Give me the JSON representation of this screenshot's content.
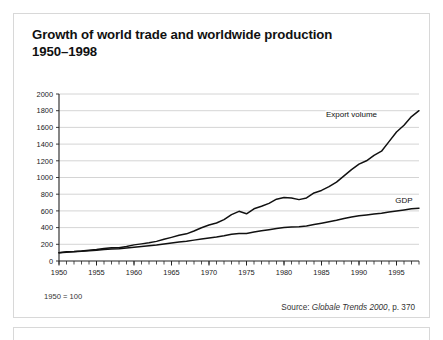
{
  "card": {
    "title_line1": "Growth of world trade and worldwide production",
    "title_line2": "1950–1998",
    "note_base": "1950 = 100",
    "source_prefix": "Source:",
    "source_title": "Globale Trends 2000",
    "source_page": ", p. 370"
  },
  "chart_data": {
    "type": "line",
    "title": "Growth of world trade and worldwide production 1950–1998",
    "subtitle": "1950 = 100",
    "xlabel": "",
    "ylabel": "",
    "xlim": [
      1950,
      1998
    ],
    "ylim": [
      0,
      2000
    ],
    "yticks": [
      0,
      200,
      400,
      600,
      800,
      1000,
      1200,
      1400,
      1600,
      1800,
      2000
    ],
    "xticks": [
      1950,
      1955,
      1960,
      1965,
      1970,
      1975,
      1980,
      1985,
      1990,
      1995
    ],
    "xtick_labels": [
      "1950",
      "1955",
      "1960",
      "1965",
      "1970",
      "1975",
      "1980",
      "1985",
      "1990",
      "1995"
    ],
    "ytick_labels": [
      "0",
      "200",
      "400",
      "600",
      "800",
      "1000",
      "1200",
      "1400",
      "1600",
      "1800",
      "2000"
    ],
    "minor_xticks_every": 1,
    "grid": "horizontal",
    "legend": "inline-labels",
    "x": [
      1950,
      1951,
      1952,
      1953,
      1954,
      1955,
      1956,
      1957,
      1958,
      1959,
      1960,
      1961,
      1962,
      1963,
      1964,
      1965,
      1966,
      1967,
      1968,
      1969,
      1970,
      1971,
      1972,
      1973,
      1974,
      1975,
      1976,
      1977,
      1978,
      1979,
      1980,
      1981,
      1982,
      1983,
      1984,
      1985,
      1986,
      1987,
      1988,
      1989,
      1990,
      1991,
      1992,
      1993,
      1994,
      1995,
      1996,
      1997,
      1998
    ],
    "series": [
      {
        "name": "Export volume",
        "label": "Export volume",
        "color": "#111111",
        "values": [
          100,
          112,
          114,
          120,
          128,
          138,
          150,
          160,
          160,
          175,
          193,
          205,
          218,
          235,
          260,
          283,
          308,
          325,
          360,
          398,
          432,
          455,
          495,
          555,
          595,
          565,
          625,
          655,
          690,
          740,
          760,
          755,
          735,
          755,
          815,
          845,
          890,
          945,
          1020,
          1095,
          1160,
          1200,
          1265,
          1315,
          1430,
          1545,
          1625,
          1730,
          1800
        ]
      },
      {
        "name": "GDP",
        "label": "GDP",
        "color": "#111111",
        "values": [
          100,
          106,
          110,
          116,
          122,
          130,
          137,
          143,
          147,
          156,
          165,
          173,
          182,
          191,
          203,
          215,
          227,
          236,
          250,
          264,
          276,
          287,
          302,
          320,
          328,
          330,
          346,
          361,
          375,
          390,
          400,
          407,
          410,
          420,
          438,
          453,
          470,
          487,
          508,
          527,
          543,
          552,
          562,
          572,
          588,
          600,
          612,
          625,
          633
        ]
      }
    ],
    "annotations": [
      {
        "text": "Export volume",
        "x": 1989,
        "y": 1720
      },
      {
        "text": "GDP",
        "x": 1996,
        "y": 700
      }
    ]
  }
}
